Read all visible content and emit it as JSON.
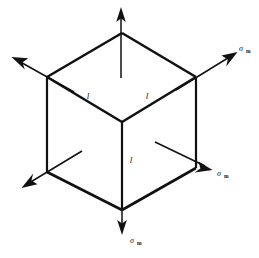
{
  "figure": {
    "background_color": "#ffffff",
    "line_color": "#111111",
    "edge_labels": [
      {
        "id": "edge-top-left",
        "text": "l",
        "x": 88,
        "y": 96
      },
      {
        "id": "edge-top-right",
        "text": "l",
        "x": 146,
        "y": 96
      },
      {
        "id": "edge-front-vertical",
        "text": "l",
        "x": 130,
        "y": 160
      }
    ],
    "stress_labels": [
      {
        "id": "stress-upper-right",
        "symbol": "σ",
        "subscript": "m",
        "x": 241,
        "y": 50
      },
      {
        "id": "stress-lower-right",
        "symbol": "σ",
        "subscript": "m",
        "x": 219,
        "y": 175
      },
      {
        "id": "stress-bottom",
        "symbol": "σ",
        "subscript": "m",
        "x": 130,
        "y": 243
      }
    ],
    "cube": {
      "vertex_top": {
        "x": 122,
        "y": 33
      },
      "vertex_left_upper": {
        "x": 47,
        "y": 77
      },
      "vertex_right_upper": {
        "x": 196,
        "y": 77
      },
      "vertex_center": {
        "x": 122,
        "y": 122
      },
      "vertex_left_lower": {
        "x": 47,
        "y": 172
      },
      "vertex_right_lower": {
        "x": 196,
        "y": 168
      },
      "vertex_bottom": {
        "x": 122,
        "y": 210
      }
    },
    "arrows": [
      {
        "id": "arrow-up",
        "direction": "up",
        "tip_x": 121,
        "tip_y": 8,
        "tail_x": 121,
        "tail_y": 78
      },
      {
        "id": "arrow-upper-left",
        "direction": "upper-left",
        "tip_x": 12,
        "tip_y": 57,
        "tail_x": 72,
        "tail_y": 90
      },
      {
        "id": "arrow-upper-right",
        "direction": "upper-right",
        "tip_x": 237,
        "tip_y": 52,
        "tail_x": 178,
        "tail_y": 88
      },
      {
        "id": "arrow-lower-left",
        "direction": "lower-left",
        "tip_x": 22,
        "tip_y": 188,
        "tail_x": 80,
        "tail_y": 152
      },
      {
        "id": "arrow-lower-right",
        "direction": "lower-right",
        "tip_x": 212,
        "tip_y": 170,
        "tail_x": 155,
        "tail_y": 142
      },
      {
        "id": "arrow-down",
        "direction": "down",
        "tip_x": 122,
        "tip_y": 234,
        "tail_x": 122,
        "tail_y": 166
      }
    ]
  }
}
